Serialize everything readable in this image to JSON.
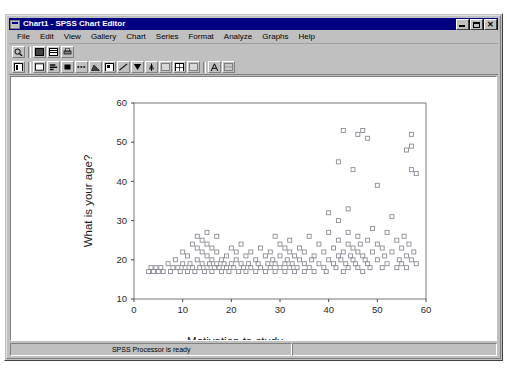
{
  "window": {
    "title": "Chart1 - SPSS Chart Editor",
    "icon": "chart-window-icon",
    "buttons": {
      "minimize": "minimize-button",
      "maximize": "maximize-button",
      "close_glyph": "✕"
    }
  },
  "menu": {
    "items": [
      {
        "label": "File",
        "accel": "F"
      },
      {
        "label": "Edit",
        "accel": "E"
      },
      {
        "label": "View",
        "accel": "V"
      },
      {
        "label": "Gallery",
        "accel": "G"
      },
      {
        "label": "Chart",
        "accel": "C"
      },
      {
        "label": "Series",
        "accel": "S"
      },
      {
        "label": "Format",
        "accel": "o"
      },
      {
        "label": "Analyze",
        "accel": "A"
      },
      {
        "label": "Graphs",
        "accel": "G"
      },
      {
        "label": "Help",
        "accel": "H"
      }
    ]
  },
  "toolbar_primary": {
    "buttons": [
      {
        "name": "zoom-tool-button"
      },
      {
        "name": "fill-pattern-button"
      },
      {
        "name": "chart-layout-button"
      },
      {
        "name": "print-button"
      }
    ]
  },
  "toolbar_secondary": {
    "buttons": [
      {
        "name": "chart-properties-button"
      },
      {
        "name": "bar-chart-button"
      },
      {
        "name": "horizontal-bar-button"
      },
      {
        "name": "stacked-bar-button"
      },
      {
        "name": "line-style-button"
      },
      {
        "name": "area-chart-button"
      },
      {
        "name": "pie-chart-button"
      },
      {
        "name": "scatter-plot-button"
      },
      {
        "name": "fit-line-button"
      },
      {
        "name": "error-bars-button"
      },
      {
        "name": "axis-label-button"
      },
      {
        "name": "grid-lines-button"
      },
      {
        "name": "marker-style-button"
      },
      {
        "name": "swap-axes-button"
      },
      {
        "name": "text-tool-button"
      },
      {
        "name": "spin-tool-button"
      }
    ]
  },
  "statusbar": {
    "message": "SPSS Processor  is ready",
    "secondary": ""
  },
  "chart_data": {
    "type": "scatter",
    "title": "",
    "xlabel": "Motivation to study",
    "ylabel": "What is your age?",
    "xlim": [
      0,
      60
    ],
    "ylim": [
      10,
      60
    ],
    "xticks": [
      0,
      10,
      20,
      30,
      40,
      50,
      60
    ],
    "yticks": [
      10,
      20,
      30,
      40,
      50,
      60
    ],
    "grid": false,
    "legend": "none",
    "marker": "open-square",
    "marker_color": "#8a8a96",
    "series": [
      {
        "name": "cases",
        "points": [
          [
            3,
            17
          ],
          [
            3.5,
            18
          ],
          [
            4,
            17
          ],
          [
            4.5,
            18
          ],
          [
            5,
            17
          ],
          [
            5.5,
            18
          ],
          [
            6,
            17
          ],
          [
            7,
            19
          ],
          [
            7.5,
            17
          ],
          [
            8,
            18
          ],
          [
            8.5,
            20
          ],
          [
            9,
            18
          ],
          [
            9.5,
            17
          ],
          [
            10,
            19
          ],
          [
            10,
            22
          ],
          [
            10.5,
            18
          ],
          [
            11,
            17
          ],
          [
            11,
            21
          ],
          [
            11.5,
            19
          ],
          [
            12,
            18
          ],
          [
            12,
            24
          ],
          [
            12.5,
            17
          ],
          [
            13,
            20
          ],
          [
            13,
            23
          ],
          [
            13,
            26
          ],
          [
            13.5,
            18
          ],
          [
            14,
            19
          ],
          [
            14,
            22
          ],
          [
            14,
            25
          ],
          [
            14.5,
            17
          ],
          [
            15,
            18
          ],
          [
            15,
            21
          ],
          [
            15,
            24
          ],
          [
            15,
            27
          ],
          [
            15.5,
            19
          ],
          [
            16,
            17
          ],
          [
            16,
            20
          ],
          [
            16,
            23
          ],
          [
            16.5,
            18
          ],
          [
            17,
            19
          ],
          [
            17,
            22
          ],
          [
            17,
            26
          ],
          [
            17.5,
            18
          ],
          [
            18,
            17
          ],
          [
            18,
            20
          ],
          [
            18.5,
            19
          ],
          [
            19,
            18
          ],
          [
            19,
            21
          ],
          [
            19.5,
            17
          ],
          [
            20,
            19
          ],
          [
            20,
            23
          ],
          [
            20.5,
            18
          ],
          [
            21,
            20
          ],
          [
            21,
            22
          ],
          [
            21.5,
            17
          ],
          [
            22,
            19
          ],
          [
            22,
            24
          ],
          [
            22.5,
            18
          ],
          [
            23,
            17
          ],
          [
            23,
            21
          ],
          [
            23.5,
            19
          ],
          [
            24,
            18
          ],
          [
            24,
            22
          ],
          [
            25,
            17
          ],
          [
            25,
            20
          ],
          [
            25.5,
            19
          ],
          [
            26,
            18
          ],
          [
            26,
            23
          ],
          [
            27,
            17
          ],
          [
            27,
            21
          ],
          [
            27.5,
            19
          ],
          [
            28,
            18
          ],
          [
            28,
            22
          ],
          [
            28.5,
            20
          ],
          [
            29,
            17
          ],
          [
            29,
            19
          ],
          [
            29,
            26
          ],
          [
            30,
            18
          ],
          [
            30,
            21
          ],
          [
            30,
            24
          ],
          [
            31,
            17
          ],
          [
            31,
            19
          ],
          [
            31,
            23
          ],
          [
            31.5,
            20
          ],
          [
            32,
            18
          ],
          [
            32,
            22
          ],
          [
            32,
            25
          ],
          [
            32.5,
            19
          ],
          [
            33,
            17
          ],
          [
            33,
            21
          ],
          [
            33.5,
            18
          ],
          [
            34,
            20
          ],
          [
            34,
            23
          ],
          [
            35,
            17
          ],
          [
            35,
            19
          ],
          [
            35,
            22
          ],
          [
            36,
            18
          ],
          [
            36,
            26
          ],
          [
            36.5,
            20
          ],
          [
            37,
            17
          ],
          [
            37,
            21
          ],
          [
            38,
            19
          ],
          [
            38,
            24
          ],
          [
            39,
            18
          ],
          [
            39,
            22
          ],
          [
            39.5,
            17
          ],
          [
            40,
            20
          ],
          [
            40,
            27
          ],
          [
            40,
            32
          ],
          [
            41,
            19
          ],
          [
            41,
            23
          ],
          [
            41.5,
            18
          ],
          [
            42,
            21
          ],
          [
            42,
            25
          ],
          [
            42,
            30
          ],
          [
            42,
            45
          ],
          [
            42.5,
            20
          ],
          [
            43,
            17
          ],
          [
            43,
            22
          ],
          [
            43,
            53
          ],
          [
            43.5,
            19
          ],
          [
            44,
            18
          ],
          [
            44,
            24
          ],
          [
            44,
            27
          ],
          [
            44,
            33
          ],
          [
            44.5,
            21
          ],
          [
            45,
            20
          ],
          [
            45,
            23
          ],
          [
            45,
            43
          ],
          [
            45.5,
            19
          ],
          [
            46,
            18
          ],
          [
            46,
            22
          ],
          [
            46,
            26
          ],
          [
            46,
            52
          ],
          [
            46.5,
            24
          ],
          [
            47,
            17
          ],
          [
            47,
            21
          ],
          [
            47,
            53
          ],
          [
            47.5,
            20
          ],
          [
            48,
            19
          ],
          [
            48,
            25
          ],
          [
            48,
            51
          ],
          [
            48.5,
            18
          ],
          [
            49,
            22
          ],
          [
            49,
            28
          ],
          [
            50,
            20
          ],
          [
            50,
            24
          ],
          [
            50,
            39
          ],
          [
            51,
            18
          ],
          [
            51,
            23
          ],
          [
            51.5,
            21
          ],
          [
            52,
            19
          ],
          [
            52,
            27
          ],
          [
            53,
            22
          ],
          [
            53,
            31
          ],
          [
            54,
            18
          ],
          [
            54,
            25
          ],
          [
            54.5,
            20
          ],
          [
            55,
            19
          ],
          [
            55,
            23
          ],
          [
            55.5,
            26
          ],
          [
            56,
            18
          ],
          [
            56,
            21
          ],
          [
            56,
            48
          ],
          [
            56.5,
            24
          ],
          [
            57,
            20
          ],
          [
            57,
            43
          ],
          [
            57,
            49
          ],
          [
            57,
            52
          ],
          [
            57.5,
            22
          ],
          [
            58,
            19
          ],
          [
            58,
            42
          ]
        ]
      }
    ]
  }
}
